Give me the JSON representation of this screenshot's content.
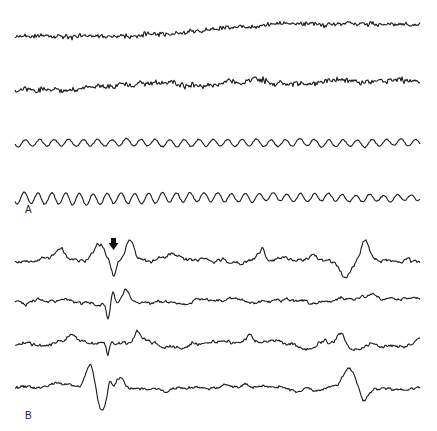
{
  "figure": {
    "panels": [
      {
        "label": "A",
        "traces": [
          {
            "name": "channel-1",
            "character": "low-amplitude fast activity with slow baseline drift upward"
          },
          {
            "name": "channel-2",
            "character": "fast activity superimposed on irregular slow waves"
          },
          {
            "name": "channel-3",
            "character": "regular low-amplitude rhythmic waves"
          },
          {
            "name": "channel-4",
            "character": "regular rhythmic waves, higher amplitude at onset"
          }
        ]
      },
      {
        "label": "B",
        "traces": [
          {
            "name": "channel-1",
            "character": "irregular slow waves with sharp transients"
          },
          {
            "name": "channel-2",
            "character": "irregular activity with spike discharge"
          },
          {
            "name": "channel-3",
            "character": "irregular activity with spike and brief fast burst"
          },
          {
            "name": "channel-4",
            "character": "slow waves with large deflection and spike"
          }
        ],
        "annotation": {
          "type": "arrow",
          "target": "spike discharge",
          "direction": "down"
        }
      }
    ],
    "colors": {
      "ink": "#1a1a1a",
      "background": "#ffffff"
    }
  }
}
